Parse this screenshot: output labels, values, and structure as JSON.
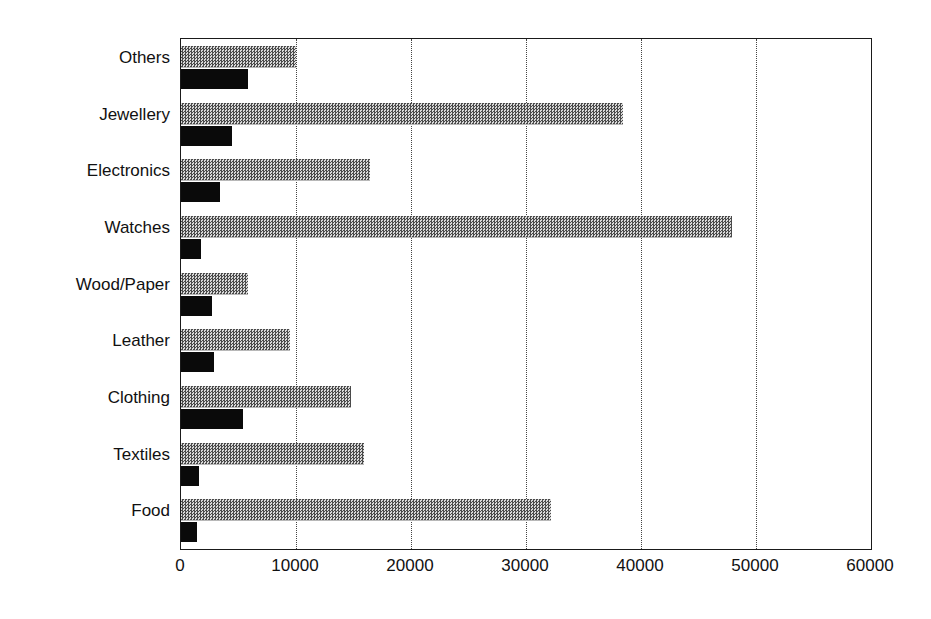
{
  "chart_data": {
    "type": "bar",
    "orientation": "horizontal",
    "title": "",
    "subtitle": "",
    "xlabel": "",
    "ylabel": "",
    "xlim": [
      0,
      60000
    ],
    "ylim": null,
    "grid": "vertical-dotted",
    "legend": "none",
    "categories": [
      "Others",
      "Jewellery",
      "Electronics",
      "Watches",
      "Wood/Paper",
      "Leather",
      "Clothing",
      "Textiles",
      "Food"
    ],
    "xticks": [
      0,
      10000,
      20000,
      30000,
      40000,
      50000,
      60000
    ],
    "xtick_labels": [
      "0",
      "10000",
      "20000",
      "30000",
      "40000",
      "50000",
      "60000"
    ],
    "series": [
      {
        "name": "series-gray",
        "style": "grey-checkered",
        "color": "#8c8c8c",
        "values": [
          10000,
          38400,
          16400,
          47900,
          5800,
          9500,
          14800,
          15900,
          32200
        ]
      },
      {
        "name": "series-black",
        "style": "solid-black",
        "color": "#0a0a0a",
        "values": [
          5850,
          4400,
          3350,
          1700,
          2700,
          2900,
          5400,
          1550,
          1400
        ]
      }
    ]
  }
}
